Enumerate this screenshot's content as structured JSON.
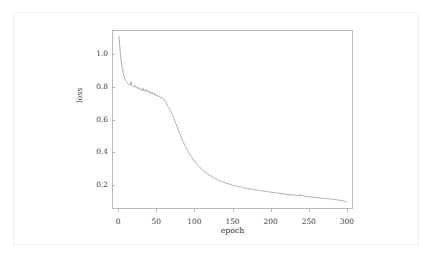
{
  "figure": {
    "background_color": "#ffffff",
    "frame_color": "#b9b9b9",
    "line_color": "#9a9a9a",
    "text_color": "#2f2f2f"
  },
  "chart_data": {
    "type": "line",
    "title": "",
    "xlabel": "epoch",
    "ylabel": "loss",
    "xlim": [
      -8,
      308
    ],
    "ylim": [
      0.055,
      1.145
    ],
    "xticks": [
      0,
      50,
      100,
      150,
      200,
      250,
      300
    ],
    "xticklabels": [
      "0",
      "50",
      "100",
      "150",
      "200",
      "250",
      "300"
    ],
    "yticks": [
      0.2,
      0.4,
      0.6,
      0.8,
      1.0
    ],
    "yticklabels": [
      "0.2",
      "0.4",
      "0.6",
      "0.8",
      "1.0"
    ],
    "grid": false,
    "legend": null,
    "series": [
      {
        "name": "loss",
        "color": "#9a9a9a",
        "x": [
          1,
          2,
          3,
          4,
          5,
          6,
          7,
          8,
          9,
          10,
          11,
          12,
          13,
          14,
          15,
          16,
          17,
          18,
          19,
          20,
          21,
          22,
          23,
          24,
          25,
          26,
          27,
          28,
          29,
          30,
          31,
          32,
          33,
          34,
          35,
          36,
          37,
          38,
          39,
          40,
          41,
          42,
          43,
          44,
          45,
          46,
          47,
          48,
          49,
          50,
          51,
          52,
          53,
          54,
          55,
          56,
          57,
          58,
          59,
          60,
          61,
          62,
          63,
          64,
          65,
          66,
          67,
          68,
          69,
          70,
          71,
          72,
          73,
          74,
          75,
          76,
          77,
          78,
          79,
          80,
          81,
          82,
          83,
          84,
          85,
          86,
          87,
          88,
          89,
          90,
          91,
          92,
          93,
          94,
          95,
          96,
          97,
          98,
          99,
          100,
          102,
          104,
          106,
          108,
          110,
          112,
          114,
          116,
          118,
          120,
          122,
          124,
          126,
          128,
          130,
          132,
          134,
          136,
          138,
          140,
          142,
          144,
          146,
          148,
          150,
          152,
          154,
          156,
          158,
          160,
          162,
          164,
          166,
          168,
          170,
          172,
          174,
          176,
          178,
          180,
          182,
          184,
          186,
          188,
          190,
          192,
          194,
          196,
          198,
          200,
          204,
          208,
          212,
          216,
          220,
          224,
          228,
          232,
          236,
          240,
          244,
          248,
          252,
          256,
          260,
          264,
          268,
          272,
          276,
          280,
          284,
          288,
          292,
          296,
          299
        ],
        "y": [
          1.105,
          1.055,
          1.0,
          0.958,
          0.925,
          0.898,
          0.877,
          0.861,
          0.848,
          0.838,
          0.83,
          0.824,
          0.818,
          0.814,
          0.812,
          0.809,
          0.83,
          0.806,
          0.802,
          0.8,
          0.801,
          0.808,
          0.796,
          0.793,
          0.799,
          0.79,
          0.787,
          0.793,
          0.783,
          0.78,
          0.786,
          0.777,
          0.789,
          0.774,
          0.78,
          0.772,
          0.782,
          0.769,
          0.775,
          0.766,
          0.763,
          0.771,
          0.76,
          0.757,
          0.765,
          0.754,
          0.751,
          0.758,
          0.748,
          0.745,
          0.75,
          0.742,
          0.739,
          0.744,
          0.736,
          0.732,
          0.736,
          0.727,
          0.722,
          0.724,
          0.716,
          0.709,
          0.7,
          0.69,
          0.681,
          0.676,
          0.668,
          0.657,
          0.651,
          0.641,
          0.63,
          0.619,
          0.607,
          0.596,
          0.584,
          0.572,
          0.56,
          0.548,
          0.536,
          0.524,
          0.513,
          0.501,
          0.49,
          0.479,
          0.468,
          0.458,
          0.448,
          0.438,
          0.429,
          0.42,
          0.411,
          0.403,
          0.395,
          0.387,
          0.38,
          0.373,
          0.366,
          0.359,
          0.353,
          0.347,
          0.336,
          0.325,
          0.315,
          0.306,
          0.297,
          0.289,
          0.281,
          0.274,
          0.267,
          0.261,
          0.255,
          0.249,
          0.244,
          0.239,
          0.234,
          0.23,
          0.226,
          0.222,
          0.219,
          0.215,
          0.212,
          0.209,
          0.206,
          0.203,
          0.2,
          0.198,
          0.196,
          0.193,
          0.191,
          0.196,
          0.187,
          0.185,
          0.183,
          0.182,
          0.18,
          0.178,
          0.177,
          0.175,
          0.174,
          0.172,
          0.171,
          0.169,
          0.168,
          0.166,
          0.165,
          0.163,
          0.162,
          0.161,
          0.159,
          0.158,
          0.155,
          0.153,
          0.15,
          0.148,
          0.145,
          0.143,
          0.141,
          0.139,
          0.137,
          0.141,
          0.133,
          0.131,
          0.129,
          0.127,
          0.125,
          0.123,
          0.121,
          0.119,
          0.117,
          0.115,
          0.112,
          0.11,
          0.107,
          0.104,
          0.098
        ]
      }
    ]
  }
}
